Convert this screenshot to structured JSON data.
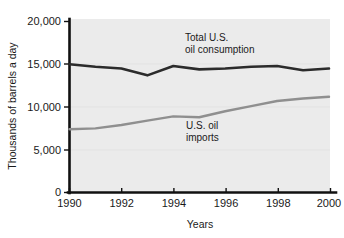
{
  "chart_data": {
    "type": "line",
    "title": "",
    "xlabel": "Years",
    "ylabel": "Thousands of barrels a day",
    "xlim": [
      1990,
      2000
    ],
    "ylim": [
      0,
      20000
    ],
    "grid": false,
    "legend_position": "inline-annotations",
    "x": [
      1990,
      1991,
      1992,
      1993,
      1994,
      1995,
      1996,
      1997,
      1998,
      1999,
      2000
    ],
    "xtick_labels": [
      "1990",
      "1992",
      "1994",
      "1996",
      "1998",
      "2000"
    ],
    "xticks": [
      1990,
      1992,
      1994,
      1996,
      1998,
      2000
    ],
    "ytick_labels": [
      "0",
      "5,000",
      "10,000",
      "15,000",
      "20,000"
    ],
    "yticks": [
      0,
      5000,
      10000,
      15000,
      20000
    ],
    "series": [
      {
        "name": "Total U.S. oil consumption",
        "color": "#2b2b2b",
        "values": [
          15000,
          14700,
          14500,
          13700,
          14800,
          14400,
          14500,
          14700,
          14800,
          14300,
          14500
        ]
      },
      {
        "name": "U.S. oil imports",
        "color": "#8f8f8f",
        "values": [
          7400,
          7500,
          7900,
          8400,
          8900,
          8800,
          9500,
          10100,
          10700,
          11000,
          11200
        ]
      }
    ],
    "annotations": [
      {
        "id": "consumption-label",
        "lines": [
          "Total U.S.",
          "oil consumption"
        ],
        "x": 1996.2,
        "y": 17400
      },
      {
        "id": "imports-label",
        "lines": [
          "U.S. oil",
          "imports"
        ],
        "x": 1996.2,
        "y": 6700
      }
    ]
  },
  "axis": {
    "y_title": "Thousands of barrels a day",
    "x_title": "Years",
    "y_labels": {
      "t20000": "20,000",
      "t15000": "15,000",
      "t10000": "10,000",
      "t5000": "5,000",
      "t0": "0"
    },
    "x_labels": {
      "t1990": "1990",
      "t1992": "1992",
      "t1994": "1994",
      "t1996": "1996",
      "t1998": "1998",
      "t2000": "2000"
    }
  },
  "annotations": {
    "consumption_line1": "Total U.S.",
    "consumption_line2": "oil consumption",
    "imports_line1": "U.S. oil",
    "imports_line2": "imports"
  },
  "colors": {
    "plot_background": "#ebebeb",
    "axis": "#111111",
    "consumption": "#2b2b2b",
    "imports": "#8f8f8f",
    "page_background": "#ffffff"
  }
}
